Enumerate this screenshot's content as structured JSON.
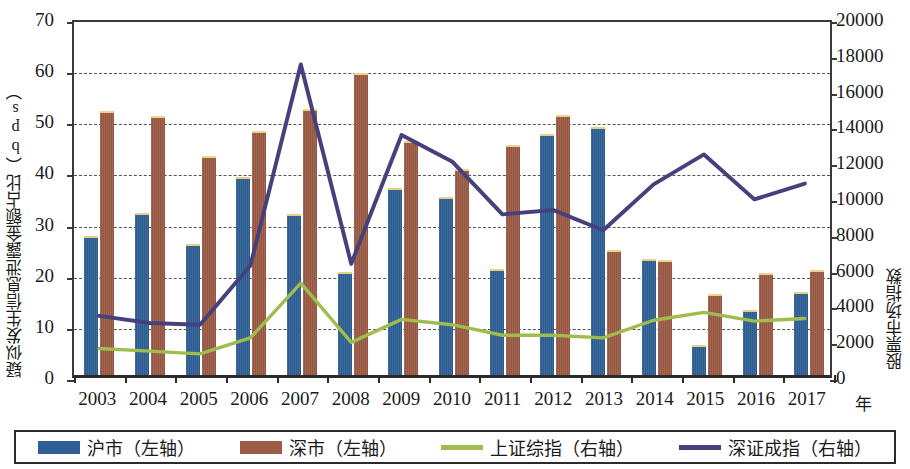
{
  "chart_data": {
    "type": "bar",
    "title": "",
    "xlabel": "年",
    "ylabel": "疑似发生信息泄露金额占比（bps）",
    "ylabel_right": "股票市场指数",
    "categories": [
      "2003",
      "2004",
      "2005",
      "2006",
      "2007",
      "2008",
      "2009",
      "2010",
      "2011",
      "2012",
      "2013",
      "2014",
      "2015",
      "2016",
      "2017"
    ],
    "ylim": [
      0,
      70
    ],
    "yticks": [
      "0",
      "10",
      "20",
      "30",
      "40",
      "50",
      "60",
      "70"
    ],
    "ylim_right": [
      0,
      20000
    ],
    "yticks_right": [
      "0",
      "2000",
      "4000",
      "6000",
      "8000",
      "10000",
      "12000",
      "14000",
      "16000",
      "18000",
      "20000"
    ],
    "grid": true,
    "legend_position": "bottom",
    "series": [
      {
        "name": "沪市（左轴）",
        "type": "bar",
        "axis": "left",
        "color": "#2e6096",
        "values": [
          26.8,
          31.2,
          25.3,
          38.4,
          31.0,
          19.8,
          36.1,
          34.5,
          20.4,
          46.7,
          48.2,
          22.2,
          5.5,
          12.4,
          15.8
        ]
      },
      {
        "name": "深市（左轴）",
        "type": "bar",
        "axis": "left",
        "color": "#9c5b44",
        "values": [
          51.3,
          50.2,
          42.4,
          47.3,
          51.6,
          58.7,
          45.4,
          39.9,
          44.6,
          50.5,
          24.1,
          22.1,
          15.4,
          19.5,
          20.2
        ]
      },
      {
        "name": "上证综指（右轴）",
        "type": "line",
        "axis": "right",
        "color": "#9ebd4e",
        "values": [
          1500,
          1350,
          1200,
          2100,
          5200,
          1850,
          3150,
          2850,
          2250,
          2250,
          2100,
          3100,
          3550,
          3050,
          3200
        ]
      },
      {
        "name": "深证成指（右轴）",
        "type": "line",
        "axis": "right",
        "color": "#46417c",
        "values": [
          3350,
          2950,
          2850,
          6200,
          17600,
          6300,
          13600,
          12100,
          9100,
          9350,
          8200,
          10800,
          12500,
          9950,
          10850
        ]
      }
    ]
  },
  "axes": {
    "left_title": "疑似发生信息泄露金额占比（bps）",
    "right_title": "股票市场指数",
    "x_title": "年"
  }
}
